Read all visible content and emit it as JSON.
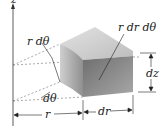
{
  "diagram": {
    "axis": {
      "label": "z"
    },
    "labels": {
      "arc_length": "r dθ",
      "top_area": "r dr dθ",
      "angle": "dθ",
      "height": "dz",
      "radius": "r",
      "radial_width": "dr"
    },
    "colors": {
      "top_face": "#cfcfcf",
      "front_face": "#8a8a8a",
      "side_face": "#b5b5b5",
      "lines": "#333333"
    }
  }
}
